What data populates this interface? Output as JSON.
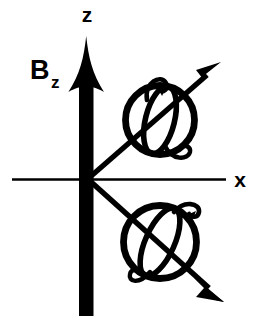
{
  "figure": {
    "background_color": "#ffffff",
    "ink_color": "#000000",
    "width": 259,
    "height": 329
  },
  "labels": {
    "z_axis": "z",
    "x_axis": "x",
    "field_symbol": "B",
    "field_subscript": "z"
  },
  "axes": {
    "vertical": {
      "name": "z-axis",
      "style": "thick-filled-arrow",
      "x": 86,
      "y_top": 36,
      "y_bottom": 316,
      "bar_width": 14,
      "arrowhead_length": 48,
      "arrowhead_halfwidth": 17,
      "direction": "up"
    },
    "horizontal": {
      "name": "x-axis",
      "style": "thin-line",
      "y": 179,
      "x_left": 12,
      "x_right": 226,
      "stroke_width": 2.4,
      "direction": "right"
    },
    "origin": {
      "x": 86,
      "y": 179
    }
  },
  "spins": [
    {
      "name": "spin-up",
      "circle": {
        "cx": 160,
        "cy": 120,
        "r": 35,
        "stroke_width": 6.5
      },
      "meridian": {
        "rx": 15,
        "ry": 35,
        "rotation_deg": 12,
        "stroke_width": 5.5
      },
      "moment_arrow": {
        "from": {
          "x": 92,
          "y": 175
        },
        "to": {
          "x": 219,
          "y": 64
        },
        "stroke_width": 5,
        "arrowhead_length": 22,
        "direction": "up-right",
        "angle_deg": 41
      },
      "curl_top": {
        "cx": 157,
        "cy": 83,
        "direction": "counterclockwise"
      },
      "curl_bottom": {
        "cx": 176,
        "cy": 156,
        "direction": "counterclockwise"
      }
    },
    {
      "name": "spin-down",
      "circle": {
        "cx": 160,
        "cy": 242,
        "r": 37,
        "stroke_width": 6.5
      },
      "meridian": {
        "rx": 15,
        "ry": 37,
        "rotation_deg": 22,
        "stroke_width": 5.5
      },
      "moment_arrow": {
        "from": {
          "x": 92,
          "y": 184
        },
        "to": {
          "x": 222,
          "y": 300
        },
        "stroke_width": 5,
        "arrowhead_length": 22,
        "direction": "down-right",
        "angle_deg": -41
      },
      "curl_top": {
        "cx": 190,
        "cy": 207,
        "direction": "counterclockwise"
      },
      "curl_bottom": {
        "cx": 145,
        "cy": 278,
        "direction": "counterclockwise"
      }
    }
  ],
  "label_positions": {
    "z": {
      "x": 86,
      "y": 22,
      "anchor": "middle"
    },
    "x": {
      "x": 238,
      "y": 187,
      "anchor": "middle"
    },
    "B": {
      "x": 30,
      "y": 78,
      "anchor": "start"
    },
    "B_sub": {
      "x": 53,
      "y": 86,
      "anchor": "start"
    }
  }
}
